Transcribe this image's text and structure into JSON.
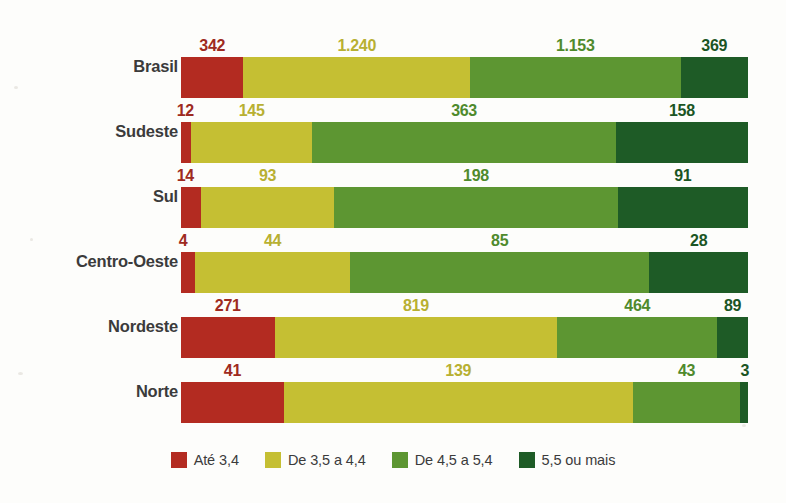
{
  "chart_data": {
    "type": "bar",
    "subtype": "stacked-horizontal-100-percent",
    "title": "",
    "subtitle": "",
    "xlabel": "",
    "ylabel": "",
    "categories": [
      "Brasil",
      "Sudeste",
      "Sul",
      "Centro-Oeste",
      "Nordeste",
      "Norte"
    ],
    "series": [
      {
        "name": "Até 3,4",
        "color": "#b32b21",
        "label_color": "#9e2a20",
        "values": [
          342,
          12,
          14,
          4,
          271,
          41
        ]
      },
      {
        "name": "De 3,5 a 4,4",
        "color": "#c5bf33",
        "label_color": "#b8b032",
        "values": [
          1240,
          145,
          93,
          44,
          819,
          139
        ]
      },
      {
        "name": "De 4,5 a 5,4",
        "color": "#5d9632",
        "label_color": "#4f8a2c",
        "values": [
          1153,
          363,
          198,
          85,
          464,
          43
        ]
      },
      {
        "name": "5,5 ou mais",
        "color": "#1e5b26",
        "label_color": "#1b5524",
        "values": [
          369,
          158,
          91,
          28,
          89,
          3
        ]
      }
    ],
    "value_labels": {
      "Brasil": [
        "342",
        "1.240",
        "1.153",
        "369"
      ],
      "Sudeste": [
        "12",
        "145",
        "363",
        "158"
      ],
      "Sul": [
        "14",
        "93",
        "198",
        "91"
      ],
      "Centro-Oeste": [
        "4",
        "44",
        "85",
        "28"
      ],
      "Nordeste": [
        "271",
        "819",
        "464",
        "89"
      ],
      "Norte": [
        "41",
        "139",
        "43",
        "3"
      ]
    },
    "row_totals": [
      3104,
      678,
      396,
      161,
      1643,
      226
    ],
    "grid": false,
    "legend_position": "bottom",
    "background_color": "#fdfdfb",
    "label_text_color": "#3b3b3b"
  },
  "rows": [
    {
      "label": "Brasil",
      "segments": [
        {
          "value_label": "342",
          "value": 342
        },
        {
          "value_label": "1.240",
          "value": 1240
        },
        {
          "value_label": "1.153",
          "value": 1153
        },
        {
          "value_label": "369",
          "value": 369
        }
      ]
    },
    {
      "label": "Sudeste",
      "segments": [
        {
          "value_label": "12",
          "value": 12
        },
        {
          "value_label": "145",
          "value": 145
        },
        {
          "value_label": "363",
          "value": 363
        },
        {
          "value_label": "158",
          "value": 158
        }
      ]
    },
    {
      "label": "Sul",
      "segments": [
        {
          "value_label": "14",
          "value": 14
        },
        {
          "value_label": "93",
          "value": 93
        },
        {
          "value_label": "198",
          "value": 198
        },
        {
          "value_label": "91",
          "value": 91
        }
      ]
    },
    {
      "label": "Centro-Oeste",
      "segments": [
        {
          "value_label": "4",
          "value": 4
        },
        {
          "value_label": "44",
          "value": 44
        },
        {
          "value_label": "85",
          "value": 85
        },
        {
          "value_label": "28",
          "value": 28
        }
      ]
    },
    {
      "label": "Nordeste",
      "segments": [
        {
          "value_label": "271",
          "value": 271
        },
        {
          "value_label": "819",
          "value": 819
        },
        {
          "value_label": "464",
          "value": 464
        },
        {
          "value_label": "89",
          "value": 89
        }
      ]
    },
    {
      "label": "Norte",
      "segments": [
        {
          "value_label": "41",
          "value": 41
        },
        {
          "value_label": "139",
          "value": 139
        },
        {
          "value_label": "43",
          "value": 43
        },
        {
          "value_label": "3",
          "value": 3
        }
      ]
    }
  ],
  "legend": {
    "items": [
      {
        "label": "Até 3,4",
        "color": "#b32b21"
      },
      {
        "label": "De 3,5 a 4,4",
        "color": "#c5bf33"
      },
      {
        "label": "De 4,5 a 5,4",
        "color": "#5d9632"
      },
      {
        "label": "5,5 ou mais",
        "color": "#1e5b26"
      }
    ]
  }
}
